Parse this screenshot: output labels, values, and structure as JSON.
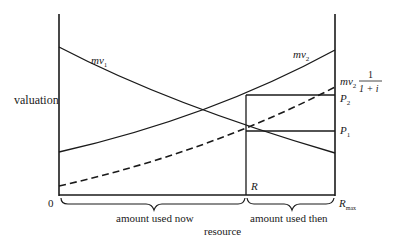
{
  "diagram": {
    "y_axis_label": "valuation",
    "x_axis_label": "resource",
    "origin_label": "0",
    "curves": {
      "mv1": {
        "label_main": "mv",
        "label_sub": "1"
      },
      "mv2": {
        "label_main": "mv",
        "label_sub": "2"
      },
      "mv2_discounted": {
        "label_main": "mv",
        "label_sub": "2",
        "frac_num": "1",
        "frac_den": "1 + i"
      }
    },
    "points": {
      "P2": {
        "label_main": "P",
        "label_sub": "2"
      },
      "P1": {
        "label_main": "P",
        "label_sub": "1"
      },
      "R": {
        "label": "R"
      },
      "Rmax": {
        "label_main": "R",
        "label_sub": "max"
      }
    },
    "braces": {
      "now": "amount used now",
      "then": "amount used then"
    },
    "colors": {
      "line": "#1a1a1a",
      "background": "#ffffff"
    }
  }
}
